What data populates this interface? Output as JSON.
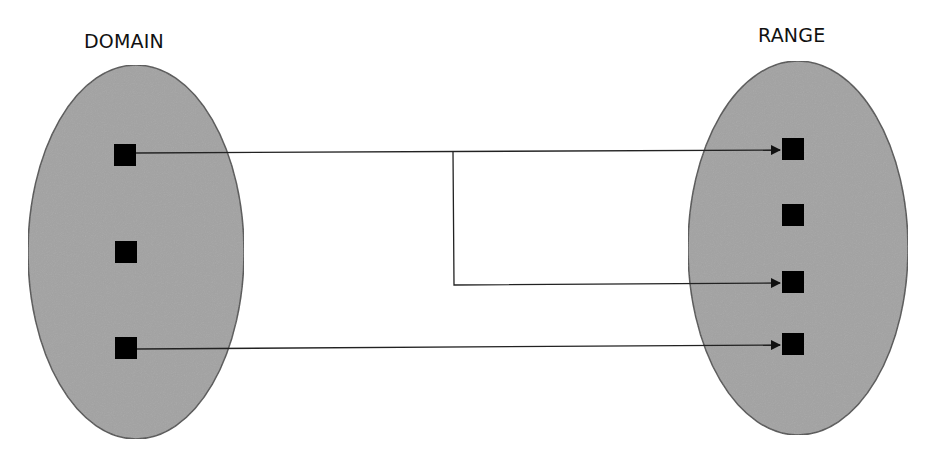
{
  "diagram": {
    "type": "function-mapping",
    "domain": {
      "title": "DOMAIN",
      "fill_color": "#a3a3a3",
      "stroke_color": "#555555",
      "elements": [
        {
          "id": "d1",
          "x": 125,
          "y": 155
        },
        {
          "id": "d2",
          "x": 126,
          "y": 252
        },
        {
          "id": "d3",
          "x": 126,
          "y": 348
        }
      ]
    },
    "range": {
      "title": "RANGE",
      "fill_color": "#a3a3a3",
      "stroke_color": "#555555",
      "elements": [
        {
          "id": "r1",
          "x": 793,
          "y": 149
        },
        {
          "id": "r2",
          "x": 793,
          "y": 215
        },
        {
          "id": "r3",
          "x": 793,
          "y": 282
        },
        {
          "id": "r4",
          "x": 793,
          "y": 344
        }
      ]
    },
    "mappings": [
      {
        "from": "d1",
        "to": "r1"
      },
      {
        "from": "d1",
        "to": "r3"
      },
      {
        "from": "d3",
        "to": "r4"
      }
    ],
    "element_color": "#000000",
    "arrow_color": "#222222"
  }
}
